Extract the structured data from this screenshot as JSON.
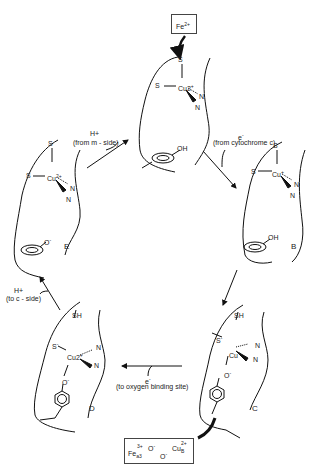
{
  "top_box": {
    "label": "Fe",
    "sup": "2+",
    "sub": "c"
  },
  "bottom_box": {
    "fe": "Fe",
    "fe_sup": "3+",
    "fe_sub": "a3",
    "o1": "O",
    "o1_sup": "-",
    "o2": "O",
    "o2_sup": "-",
    "cu": "Cu",
    "cu_sup": "2+",
    "cu_sub": "B"
  },
  "states": {
    "A": {
      "s1": "S",
      "s2": "S",
      "cu": "Cu2",
      "cu_sup": "+",
      "n1": "N",
      "n2": "N",
      "phenol": "OH"
    },
    "B": {
      "label": "B",
      "s1": "S",
      "s2": "S",
      "cu": "Cu",
      "cu_sup": "+",
      "n1": "N",
      "n2": "N",
      "phenol": "OH"
    },
    "C": {
      "label": "C",
      "sh": "SH",
      "s": "S",
      "cu": "Cu",
      "cu_sup": "+",
      "n1": "N",
      "n2": "N",
      "o": "O"
    },
    "D": {
      "label": "D",
      "sh": "SH",
      "s": "S",
      "cu": "Cu2",
      "cu_sup": "+",
      "n1": "N",
      "n2": "N",
      "o": "O"
    },
    "E": {
      "label": "E",
      "s1": "S",
      "s2": "S",
      "cu": "Cu",
      "cu_sup": "2+",
      "n1": "N",
      "n2": "N",
      "phenolate": "O"
    }
  },
  "transitions": {
    "e_to_a": {
      "species": "H+",
      "note": "(from m - side)"
    },
    "a_to_b": {
      "species": "e",
      "species_sup": "-",
      "note": "(from cytochrome c)"
    },
    "d_to_e": {
      "species": "H+",
      "note": "(to c - side)"
    },
    "c_to_d": {
      "species": "e",
      "species_sup": "-",
      "note": "(to oxygen binding site)"
    }
  }
}
